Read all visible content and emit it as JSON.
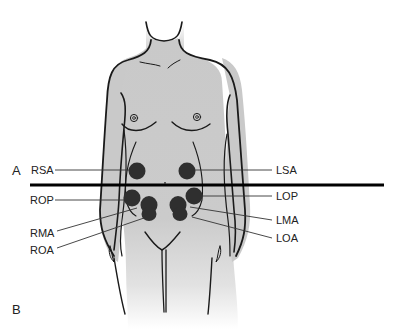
{
  "figure": {
    "panel_labels": {
      "a": "A",
      "b": "B"
    },
    "colors": {
      "skin": "#c8c8c8",
      "outline": "#1a1a1a",
      "spot": "#2f2f2f",
      "divider": "#000000",
      "leader": "#333333"
    },
    "positions": {
      "right_side": [
        {
          "id": "RSA",
          "label": "RSA"
        },
        {
          "id": "ROP",
          "label": "ROP"
        },
        {
          "id": "RMA",
          "label": "RMA"
        },
        {
          "id": "ROA",
          "label": "ROA"
        }
      ],
      "left_side": [
        {
          "id": "LSA",
          "label": "LSA"
        },
        {
          "id": "LOP",
          "label": "LOP"
        },
        {
          "id": "LMA",
          "label": "LMA"
        },
        {
          "id": "LOA",
          "label": "LOA"
        }
      ]
    }
  }
}
